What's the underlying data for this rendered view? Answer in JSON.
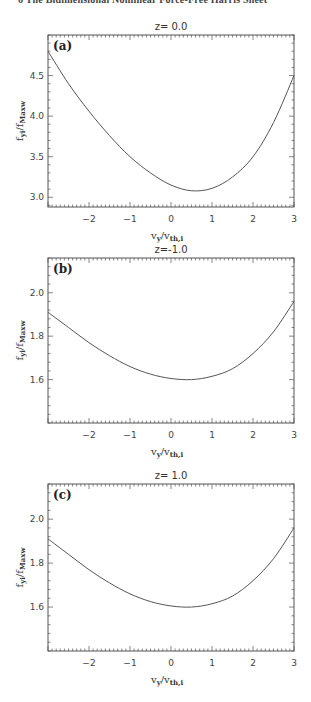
{
  "page": {
    "header_text": "6    The Bidimensional Nonlinear Force-Free Harris Sheet"
  },
  "chart_data": [
    {
      "type": "line",
      "panel_label": "(a)",
      "title": "z=  0.0",
      "xlabel": "v_y/v_th,i",
      "ylabel": "f_yi/f_Maxw",
      "xlim": [
        -3,
        3
      ],
      "ylim": [
        2.88,
        5.0
      ],
      "xticks": [
        -2,
        -1,
        0,
        1,
        2,
        3
      ],
      "yticks": [
        3.0,
        3.5,
        4.0,
        4.5
      ],
      "ytick_labels": [
        "3.0",
        "3.5",
        "4.0",
        "4.5"
      ],
      "grid": false,
      "x": [
        -3.0,
        -2.5,
        -2.0,
        -1.5,
        -1.0,
        -0.5,
        0.0,
        0.5,
        1.0,
        1.5,
        2.0,
        2.5,
        3.0
      ],
      "y": [
        4.8,
        4.4,
        4.06,
        3.76,
        3.5,
        3.3,
        3.15,
        3.08,
        3.11,
        3.25,
        3.5,
        3.92,
        4.5
      ]
    },
    {
      "type": "line",
      "panel_label": "(b)",
      "title": "z=-1.0",
      "xlabel": "v_y/v_th,i",
      "ylabel": "f_yi/f_Maxw",
      "xlim": [
        -3,
        3
      ],
      "ylim": [
        1.4,
        2.16
      ],
      "xticks": [
        -2,
        -1,
        0,
        1,
        2,
        3
      ],
      "yticks": [
        1.6,
        1.8,
        2.0
      ],
      "ytick_labels": [
        "1.6",
        "1.8",
        "2.0"
      ],
      "grid": false,
      "x": [
        -3.0,
        -2.5,
        -2.0,
        -1.5,
        -1.0,
        -0.5,
        0.0,
        0.5,
        1.0,
        1.5,
        2.0,
        2.5,
        3.0
      ],
      "y": [
        1.91,
        1.84,
        1.77,
        1.71,
        1.66,
        1.625,
        1.605,
        1.6,
        1.615,
        1.65,
        1.72,
        1.82,
        1.96
      ]
    },
    {
      "type": "line",
      "panel_label": "(c)",
      "title": "z=  1.0",
      "xlabel": "v_y/v_th,i",
      "ylabel": "f_yi/f_Maxw",
      "xlim": [
        -3,
        3
      ],
      "ylim": [
        1.4,
        2.16
      ],
      "xticks": [
        -2,
        -1,
        0,
        1,
        2,
        3
      ],
      "yticks": [
        1.6,
        1.8,
        2.0
      ],
      "ytick_labels": [
        "1.6",
        "1.8",
        "2.0"
      ],
      "grid": false,
      "x": [
        -3.0,
        -2.5,
        -2.0,
        -1.5,
        -1.0,
        -0.5,
        0.0,
        0.5,
        1.0,
        1.5,
        2.0,
        2.5,
        3.0
      ],
      "y": [
        1.91,
        1.84,
        1.77,
        1.71,
        1.66,
        1.625,
        1.605,
        1.6,
        1.615,
        1.65,
        1.72,
        1.82,
        1.96
      ]
    }
  ],
  "labels": {
    "ylabel_main": "f",
    "ylabel_sub1": "yi",
    "ylabel_sep": "/f",
    "ylabel_sub2": "Maxw",
    "xlabel_main": "v",
    "xlabel_sub1": "y",
    "xlabel_sep": "/v",
    "xlabel_sub2": "th,i"
  },
  "colors": {
    "line": "#555555",
    "axis": "#555555",
    "text": "#333333"
  }
}
